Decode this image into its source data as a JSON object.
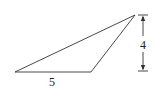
{
  "diagram": {
    "type": "triangle-with-dimensions",
    "colors": {
      "stroke": "#333333",
      "text": "#222222",
      "background": "#ffffff"
    },
    "vertices": {
      "left": [
        15,
        72
      ],
      "bottom_right": [
        91,
        72
      ],
      "top": [
        135,
        15
      ]
    },
    "labels": {
      "base": "5",
      "height": "4"
    },
    "dimension_line": {
      "x": 143,
      "y_top": 15,
      "y_bottom": 71
    }
  }
}
